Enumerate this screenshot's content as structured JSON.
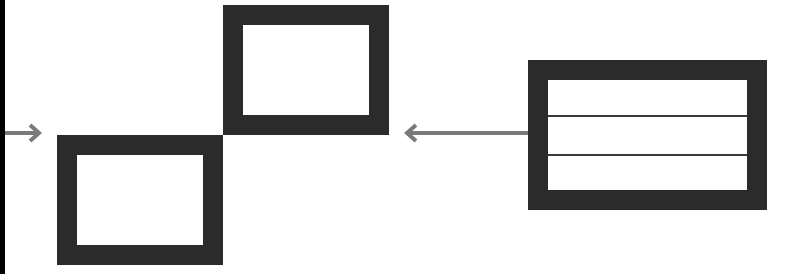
{
  "colors": {
    "background": "#ffffff",
    "box_border": "#2b2b2b",
    "arrow": "#7a7a7a",
    "edge_bar": "#000000",
    "divider": "#3a3a3a"
  },
  "diagram": {
    "nodes": [
      {
        "id": "box-a",
        "x": 57,
        "y": 135,
        "w": 166,
        "h": 130,
        "border": 20,
        "rows": 1
      },
      {
        "id": "box-b",
        "x": 223,
        "y": 5,
        "w": 166,
        "h": 130,
        "border": 20,
        "rows": 1
      },
      {
        "id": "box-c",
        "x": 528,
        "y": 60,
        "w": 239,
        "h": 150,
        "border": 20,
        "rows": 3
      }
    ],
    "edges": [
      {
        "id": "arrow-in",
        "from_x": 5,
        "to_x": 41,
        "y": 133,
        "direction": "right"
      },
      {
        "id": "arrow-c-to-b",
        "from_x": 530,
        "to_x": 405,
        "y": 133,
        "direction": "left"
      }
    ]
  }
}
